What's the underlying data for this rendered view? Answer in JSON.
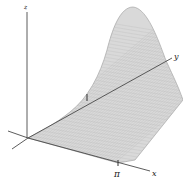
{
  "figure": {
    "axes": {
      "x_label": "x",
      "y_label": "y",
      "z_label": "z"
    },
    "tick_labels": {
      "x_tick": "π",
      "y_tick": "1"
    },
    "colors": {
      "surface_fill": "#d9d9d9",
      "surface_edge": "#9a9a9a",
      "mesh": "#bdbdbd",
      "axis": "#4a4a4a",
      "text": "#222222"
    }
  }
}
